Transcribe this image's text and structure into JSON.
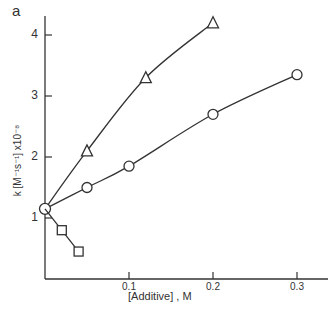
{
  "chart_data": {
    "type": "line",
    "panel_label": "a",
    "title": "",
    "xlabel": "[Additive] , M",
    "ylabel": "k [M⁻¹s⁻¹] x10⁻⁸",
    "xlim": [
      0,
      0.32
    ],
    "ylim": [
      0,
      4.3
    ],
    "xticks": [
      0.1,
      0.2,
      0.3
    ],
    "xtick_labels": [
      "0.1",
      "0.2",
      "0.3"
    ],
    "yticks": [
      1,
      2,
      3,
      4
    ],
    "ytick_labels": [
      "1",
      "2",
      "3",
      "4"
    ],
    "grid": false,
    "legend": null,
    "series": [
      {
        "name": "triangles",
        "marker": "triangle",
        "x": [
          0,
          0.05,
          0.12,
          0.2
        ],
        "y": [
          1.15,
          2.1,
          3.3,
          4.2
        ]
      },
      {
        "name": "circles",
        "marker": "circle",
        "x": [
          0,
          0.05,
          0.1,
          0.2,
          0.3
        ],
        "y": [
          1.15,
          1.5,
          1.85,
          2.7,
          3.35
        ]
      },
      {
        "name": "squares",
        "marker": "square",
        "x": [
          0,
          0.02,
          0.04
        ],
        "y": [
          1.15,
          0.8,
          0.45
        ]
      }
    ]
  }
}
